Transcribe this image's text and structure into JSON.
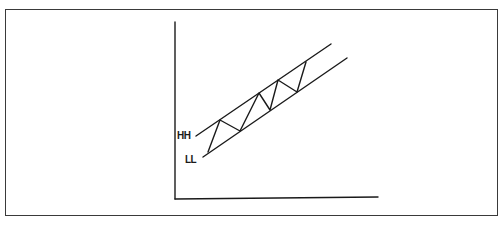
{
  "diagram": {
    "type": "ascending-channel",
    "labels": {
      "upper": "HH",
      "lower": "LL"
    },
    "colors": {
      "stroke": "#1a1a1a",
      "frame": "#3a3a3a",
      "background": "#ffffff"
    },
    "lines": {
      "upper_trendline": [
        [
          196,
          136
        ],
        [
          331,
          44
        ]
      ],
      "lower_trendline": [
        [
          203,
          157
        ],
        [
          347,
          58
        ]
      ],
      "zigzag": [
        [
          208,
          152
        ],
        [
          220,
          120
        ],
        [
          240,
          131
        ],
        [
          259,
          93
        ],
        [
          270,
          110
        ],
        [
          278,
          80
        ],
        [
          297,
          92
        ],
        [
          306,
          62
        ]
      ]
    },
    "axes": {
      "origin": [
        175,
        199
      ],
      "y_top": 22,
      "x_right": 378
    }
  }
}
